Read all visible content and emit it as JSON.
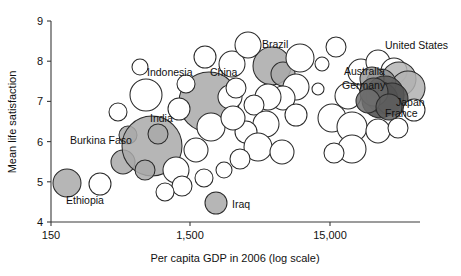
{
  "chart_data": {
    "type": "scatter",
    "title": "",
    "xlabel": "Per capita GDP in 2006 (log scale)",
    "ylabel": "Mean life satisfaction",
    "x_scale": "log",
    "x_ticks": [
      "150",
      "1,500",
      "15,000"
    ],
    "x_tick_values": [
      150,
      1500,
      15000
    ],
    "y_ticks": [
      "4",
      "5",
      "6",
      "7",
      "8",
      "9"
    ],
    "y_tick_values": [
      4,
      5,
      6,
      7,
      8,
      9
    ],
    "ylim": [
      4,
      9
    ],
    "xlim": [
      150,
      45000
    ],
    "grid": false,
    "legend": "none",
    "size_encodes": "population",
    "annotations": [
      {
        "label": "Burkina Faso",
        "x": 70,
        "y": 144,
        "anchor": "start"
      },
      {
        "label": "Ethiopia",
        "x": 66,
        "y": 204,
        "anchor": "start"
      },
      {
        "label": "India",
        "x": 150,
        "y": 122,
        "anchor": "start"
      },
      {
        "label": "Indonesia",
        "x": 147,
        "y": 76,
        "anchor": "start"
      },
      {
        "label": "China",
        "x": 210,
        "y": 76,
        "anchor": "start"
      },
      {
        "label": "Brazil",
        "x": 262,
        "y": 48,
        "anchor": "start"
      },
      {
        "label": "Iraq",
        "x": 232,
        "y": 208,
        "anchor": "start"
      },
      {
        "label": "United States",
        "x": 385,
        "y": 49,
        "anchor": "start"
      },
      {
        "label": "Australia",
        "x": 344,
        "y": 75,
        "anchor": "start"
      },
      {
        "label": "Germany",
        "x": 342,
        "y": 89,
        "anchor": "start"
      },
      {
        "label": "Japan",
        "x": 396,
        "y": 106,
        "anchor": "start"
      },
      {
        "label": "France",
        "x": 385,
        "y": 117,
        "anchor": "start"
      }
    ],
    "points": [
      {
        "name": "Ethiopia",
        "cx": 67,
        "cy": 183,
        "r": 14,
        "fill": "#a9a9a9"
      },
      {
        "name": "unlabeled-1",
        "cx": 100,
        "cy": 184,
        "r": 11,
        "fill": "#ffffff"
      },
      {
        "name": "Burkina Faso",
        "cx": 123,
        "cy": 162,
        "r": 12,
        "fill": "#a9a9a9"
      },
      {
        "name": "unlabeled-2",
        "cx": 128,
        "cy": 135,
        "r": 9,
        "fill": "#a9a9a9"
      },
      {
        "name": "India",
        "cx": 152,
        "cy": 146,
        "r": 30,
        "fill": "#a9a9a9"
      },
      {
        "name": "unlabeled-3",
        "cx": 158,
        "cy": 134,
        "r": 10,
        "fill": "#a9a9a9"
      },
      {
        "name": "unlabeled-4",
        "cx": 145,
        "cy": 170,
        "r": 10,
        "fill": "#a9a9a9"
      },
      {
        "name": "Indonesia",
        "cx": 146,
        "cy": 95,
        "r": 16,
        "fill": "#ffffff"
      },
      {
        "name": "unlabeled-5",
        "cx": 140,
        "cy": 67,
        "r": 8,
        "fill": "#ffffff"
      },
      {
        "name": "unlabeled-6",
        "cx": 176,
        "cy": 170,
        "r": 13,
        "fill": "#ffffff"
      },
      {
        "name": "unlabeled-7",
        "cx": 182,
        "cy": 186,
        "r": 10,
        "fill": "#ffffff"
      },
      {
        "name": "China",
        "cx": 209,
        "cy": 102,
        "r": 30,
        "fill": "#a9a9a9"
      },
      {
        "name": "unlabeled-8",
        "cx": 205,
        "cy": 57,
        "r": 11,
        "fill": "#ffffff"
      },
      {
        "name": "unlabeled-9",
        "cx": 232,
        "cy": 64,
        "r": 13,
        "fill": "#ffffff"
      },
      {
        "name": "unlabeled-10",
        "cx": 230,
        "cy": 97,
        "r": 12,
        "fill": "#ffffff"
      },
      {
        "name": "unlabeled-11",
        "cx": 236,
        "cy": 88,
        "r": 10,
        "fill": "#ffffff"
      },
      {
        "name": "unlabeled-12",
        "cx": 211,
        "cy": 127,
        "r": 14,
        "fill": "#ffffff"
      },
      {
        "name": "unlabeled-13",
        "cx": 196,
        "cy": 150,
        "r": 12,
        "fill": "#ffffff"
      },
      {
        "name": "Iraq",
        "cx": 216,
        "cy": 203,
        "r": 11,
        "fill": "#a9a9a9"
      },
      {
        "name": "unlabeled-14",
        "cx": 204,
        "cy": 178,
        "r": 9,
        "fill": "#ffffff"
      },
      {
        "name": "unlabeled-15",
        "cx": 224,
        "cy": 170,
        "r": 8,
        "fill": "#ffffff"
      },
      {
        "name": "unlabeled-16",
        "cx": 248,
        "cy": 45,
        "r": 13,
        "fill": "#ffffff"
      },
      {
        "name": "Brazil",
        "cx": 272,
        "cy": 66,
        "r": 19,
        "fill": "#a9a9a9"
      },
      {
        "name": "unlabeled-17",
        "cx": 283,
        "cy": 74,
        "r": 12,
        "fill": "#a9a9a9"
      },
      {
        "name": "unlabeled-18",
        "cx": 300,
        "cy": 58,
        "r": 14,
        "fill": "#ffffff"
      },
      {
        "name": "unlabeled-19",
        "cx": 296,
        "cy": 87,
        "r": 13,
        "fill": "#ffffff"
      },
      {
        "name": "unlabeled-20",
        "cx": 283,
        "cy": 98,
        "r": 12,
        "fill": "#ffffff"
      },
      {
        "name": "unlabeled-21",
        "cx": 268,
        "cy": 97,
        "r": 13,
        "fill": "#ffffff"
      },
      {
        "name": "unlabeled-22",
        "cx": 254,
        "cy": 105,
        "r": 10,
        "fill": "#ffffff"
      },
      {
        "name": "unlabeled-23",
        "cx": 266,
        "cy": 124,
        "r": 13,
        "fill": "#ffffff"
      },
      {
        "name": "unlabeled-24",
        "cx": 246,
        "cy": 132,
        "r": 11,
        "fill": "#ffffff"
      },
      {
        "name": "unlabeled-25",
        "cx": 258,
        "cy": 147,
        "r": 14,
        "fill": "#ffffff"
      },
      {
        "name": "unlabeled-26",
        "cx": 240,
        "cy": 159,
        "r": 10,
        "fill": "#ffffff"
      },
      {
        "name": "unlabeled-27",
        "cx": 282,
        "cy": 152,
        "r": 12,
        "fill": "#ffffff"
      },
      {
        "name": "unlabeled-28",
        "cx": 296,
        "cy": 115,
        "r": 11,
        "fill": "#ffffff"
      },
      {
        "name": "unlabeled-29",
        "cx": 318,
        "cy": 89,
        "r": 6,
        "fill": "#ffffff"
      },
      {
        "name": "unlabeled-30",
        "cx": 332,
        "cy": 118,
        "r": 14,
        "fill": "#ffffff"
      },
      {
        "name": "unlabeled-31",
        "cx": 348,
        "cy": 96,
        "r": 13,
        "fill": "#ffffff"
      },
      {
        "name": "unlabeled-32",
        "cx": 361,
        "cy": 72,
        "r": 13,
        "fill": "#ffffff"
      },
      {
        "name": "unlabeled-33",
        "cx": 352,
        "cy": 127,
        "r": 15,
        "fill": "#ffffff"
      },
      {
        "name": "unlabeled-34",
        "cx": 378,
        "cy": 62,
        "r": 12,
        "fill": "#ffffff"
      },
      {
        "name": "unlabeled-35",
        "cx": 394,
        "cy": 71,
        "r": 13,
        "fill": "#ffffff"
      },
      {
        "name": "United States",
        "cx": 399,
        "cy": 79,
        "r": 17,
        "fill": "#b5b5b5"
      },
      {
        "name": "unlabeled-36",
        "cx": 408,
        "cy": 88,
        "r": 17,
        "fill": "#b0b0b0"
      },
      {
        "name": "Germany",
        "cx": 381,
        "cy": 84,
        "r": 15,
        "fill": "#8f8f8f"
      },
      {
        "name": "Australia",
        "cx": 372,
        "cy": 79,
        "r": 12,
        "fill": "#9a9a9a"
      },
      {
        "name": "Japan",
        "cx": 385,
        "cy": 95,
        "r": 19,
        "fill": "#5a5a5a"
      },
      {
        "name": "France",
        "cx": 380,
        "cy": 100,
        "r": 18,
        "fill": "#4a4a4a"
      },
      {
        "name": "unlabeled-37",
        "cx": 392,
        "cy": 99,
        "r": 16,
        "fill": "#555555"
      },
      {
        "name": "unlabeled-38",
        "cx": 374,
        "cy": 92,
        "r": 14,
        "fill": "#666666"
      },
      {
        "name": "unlabeled-39",
        "cx": 368,
        "cy": 101,
        "r": 12,
        "fill": "#6e6e6e"
      },
      {
        "name": "unlabeled-40",
        "cx": 389,
        "cy": 107,
        "r": 13,
        "fill": "#5f5f5f"
      },
      {
        "name": "unlabeled-41",
        "cx": 352,
        "cy": 149,
        "r": 14,
        "fill": "#ffffff"
      },
      {
        "name": "unlabeled-42",
        "cx": 334,
        "cy": 153,
        "r": 10,
        "fill": "#ffffff"
      },
      {
        "name": "unlabeled-43",
        "cx": 378,
        "cy": 131,
        "r": 12,
        "fill": "#ffffff"
      },
      {
        "name": "unlabeled-44",
        "cx": 398,
        "cy": 128,
        "r": 10,
        "fill": "#ffffff"
      },
      {
        "name": "unlabeled-45",
        "cx": 322,
        "cy": 64,
        "r": 7,
        "fill": "#ffffff"
      },
      {
        "name": "unlabeled-46",
        "cx": 336,
        "cy": 47,
        "r": 10,
        "fill": "#ffffff"
      },
      {
        "name": "unlabeled-47",
        "cx": 414,
        "cy": 110,
        "r": 11,
        "fill": "#ffffff"
      },
      {
        "name": "unlabeled-48",
        "cx": 179,
        "cy": 109,
        "r": 11,
        "fill": "#ffffff"
      },
      {
        "name": "unlabeled-49",
        "cx": 186,
        "cy": 84,
        "r": 9,
        "fill": "#ffffff"
      },
      {
        "name": "unlabeled-50",
        "cx": 233,
        "cy": 118,
        "r": 12,
        "fill": "#ffffff"
      },
      {
        "name": "unlabeled-51",
        "cx": 165,
        "cy": 192,
        "r": 9,
        "fill": "#ffffff"
      },
      {
        "name": "unlabeled-52",
        "cx": 118,
        "cy": 112,
        "r": 9,
        "fill": "#ffffff"
      }
    ]
  }
}
